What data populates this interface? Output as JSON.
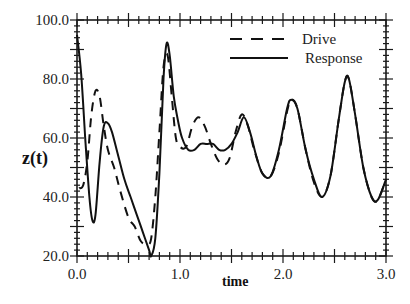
{
  "chart_data": {
    "type": "line",
    "title": "",
    "xlabel": "time",
    "ylabel": "z(t)",
    "xlim": [
      0.0,
      3.0
    ],
    "ylim": [
      20.0,
      100.0
    ],
    "x_ticks": [
      "0.0",
      "1.0",
      "2.0",
      "3.0"
    ],
    "y_ticks": [
      "20.0",
      "40.0",
      "60.0",
      "80.0",
      "100.0"
    ],
    "grid": false,
    "legend_position": "upper right",
    "series": [
      {
        "name": "Drive",
        "style": "dashed",
        "x": [
          0.02,
          0.06,
          0.1,
          0.14,
          0.18,
          0.22,
          0.26,
          0.3,
          0.36,
          0.42,
          0.5,
          0.56,
          0.62,
          0.68,
          0.72,
          0.76,
          0.8,
          0.84,
          0.88,
          0.92,
          0.96,
          1.0,
          1.06,
          1.12,
          1.18,
          1.24,
          1.3,
          1.36,
          1.42,
          1.48,
          1.54,
          1.6,
          1.66,
          1.72,
          1.8,
          1.88,
          1.96,
          2.04,
          2.08,
          2.14,
          2.22,
          2.3,
          2.38,
          2.46,
          2.54,
          2.6,
          2.64,
          2.7,
          2.78,
          2.86,
          2.92,
          3.0
        ],
        "values": [
          43,
          44,
          52,
          68,
          76,
          74,
          64,
          56,
          50,
          42,
          33,
          30,
          25,
          24,
          26,
          40,
          62,
          84,
          88,
          74,
          60,
          57,
          57,
          64,
          67,
          64,
          58,
          53,
          51,
          53,
          62,
          68,
          64,
          56,
          48,
          47,
          55,
          69,
          73,
          70,
          56,
          45,
          40,
          47,
          66,
          79,
          80,
          68,
          50,
          40,
          39,
          46
        ]
      },
      {
        "name": "Response",
        "style": "solid",
        "x": [
          0.0,
          0.04,
          0.08,
          0.12,
          0.15,
          0.18,
          0.22,
          0.26,
          0.3,
          0.34,
          0.4,
          0.46,
          0.52,
          0.58,
          0.64,
          0.7,
          0.72,
          0.76,
          0.8,
          0.84,
          0.87,
          0.9,
          0.94,
          0.98,
          1.02,
          1.08,
          1.14,
          1.2,
          1.26,
          1.32,
          1.38,
          1.44,
          1.5,
          1.56,
          1.62,
          1.68,
          1.74,
          1.8,
          1.88,
          1.96,
          2.04,
          2.08,
          2.14,
          2.22,
          2.3,
          2.38,
          2.46,
          2.54,
          2.6,
          2.64,
          2.7,
          2.78,
          2.86,
          2.92,
          3.0
        ],
        "values": [
          95,
          82,
          60,
          40,
          32,
          34,
          52,
          64,
          65,
          62,
          54,
          46,
          40,
          34,
          28,
          22,
          20,
          26,
          48,
          80,
          92,
          88,
          74,
          66,
          60,
          56,
          56,
          58,
          58,
          58,
          56,
          56,
          58,
          62,
          67,
          62,
          54,
          48,
          47,
          56,
          70,
          73,
          70,
          56,
          46,
          40,
          47,
          66,
          79,
          80,
          68,
          50,
          40,
          39,
          46
        ]
      }
    ]
  },
  "legend": {
    "items": [
      {
        "label": "Drive",
        "style": "dashed"
      },
      {
        "label": "Response",
        "style": "solid"
      }
    ]
  },
  "axes": {
    "xlabel": "time",
    "ylabel": "z(t)",
    "x_tick_labels": [
      "0.0",
      "1.0",
      "2.0",
      "3.0"
    ],
    "y_tick_labels": [
      "20.0",
      "40.0",
      "60.0",
      "80.0",
      "100.0"
    ]
  },
  "colors": {
    "line": "#111111",
    "axis": "#1a1a1a",
    "background": "#ffffff"
  }
}
